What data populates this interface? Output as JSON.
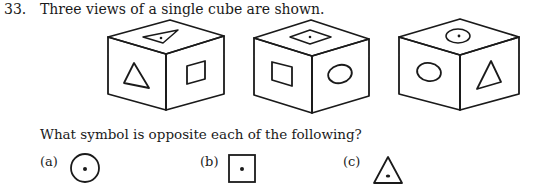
{
  "question": {
    "number": "33.",
    "text": "Three views of a single cube are shown.",
    "prompt": "What symbol is opposite each of the following?"
  },
  "cubes": [
    {
      "top": "triangle-with-dot",
      "left": "triangle",
      "right": "square"
    },
    {
      "top": "square-with-dot",
      "left": "square",
      "right": "circle"
    },
    {
      "top": "circle-with-dot",
      "left": "circle",
      "right": "triangle"
    }
  ],
  "options": [
    {
      "label": "(a)",
      "symbol": "circle-with-dot"
    },
    {
      "label": "(b)",
      "symbol": "square-with-dot"
    },
    {
      "label": "(c)",
      "symbol": "triangle-with-dot"
    }
  ]
}
